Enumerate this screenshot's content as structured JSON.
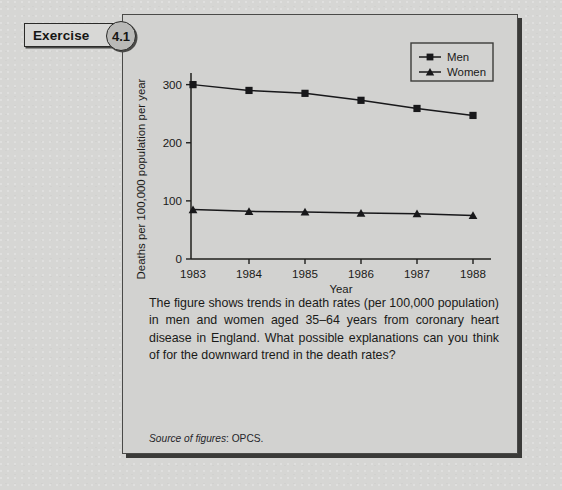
{
  "badge": {
    "label": "Exercise",
    "number": "4.1"
  },
  "chart_data": {
    "type": "line",
    "title": "",
    "xlabel": "Year",
    "ylabel": "Deaths per 100,000 population per year",
    "categories": [
      "1983",
      "1984",
      "1985",
      "1986",
      "1987",
      "1988"
    ],
    "xticklabels": [
      "1983",
      "1984",
      "1985",
      "1986",
      "1987",
      "1988"
    ],
    "yticklabels": [
      "0",
      "100",
      "200",
      "300"
    ],
    "yticks": [
      0,
      100,
      200,
      300
    ],
    "ylim": [
      0,
      320
    ],
    "grid": false,
    "legend_position": "top-right",
    "series": [
      {
        "name": "Men",
        "marker": "square",
        "values": [
          300,
          290,
          285,
          273,
          259,
          247
        ]
      },
      {
        "name": "Women",
        "marker": "triangle",
        "values": [
          85,
          82,
          81,
          79,
          78,
          75
        ]
      }
    ]
  },
  "caption": {
    "text": "The figure shows trends in death rates (per 100,000 population) in men and women aged 35–64 years from coronary heart disease in England. What possible explanations can you think of for the downward trend in the death rates?"
  },
  "source": {
    "label": "Source of figures",
    "value": "OPCS."
  },
  "colors": {
    "page_background": "#d6d6d4",
    "panel_background": "#d2d2d0",
    "ink": "#1a1a18",
    "frame": "#4a4a48",
    "series": "#1c1c1a"
  }
}
